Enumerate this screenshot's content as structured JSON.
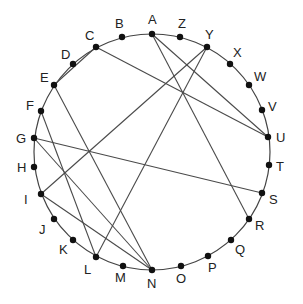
{
  "diagram": {
    "type": "circular-graph",
    "circle": {
      "cx": 152,
      "cy": 152,
      "r": 118,
      "stroke": "#444444"
    },
    "nodes": [
      {
        "id": "A",
        "x": 152,
        "y": 34,
        "lx": 148,
        "ly": 24
      },
      {
        "id": "Z",
        "x": 180,
        "y": 37,
        "lx": 178,
        "ly": 28
      },
      {
        "id": "Y",
        "x": 207,
        "y": 47,
        "lx": 205,
        "ly": 39
      },
      {
        "id": "X",
        "x": 230,
        "y": 64,
        "lx": 233,
        "ly": 57
      },
      {
        "id": "W",
        "x": 249,
        "y": 85,
        "lx": 254,
        "ly": 81
      },
      {
        "id": "V",
        "x": 262,
        "y": 110,
        "lx": 268,
        "ly": 111
      },
      {
        "id": "U",
        "x": 268,
        "y": 137,
        "lx": 276,
        "ly": 142
      },
      {
        "id": "T",
        "x": 269,
        "y": 165,
        "lx": 276,
        "ly": 171
      },
      {
        "id": "S",
        "x": 262,
        "y": 193,
        "lx": 269,
        "ly": 204
      },
      {
        "id": "R",
        "x": 249,
        "y": 219,
        "lx": 255,
        "ly": 230
      },
      {
        "id": "Q",
        "x": 231,
        "y": 240,
        "lx": 235,
        "ly": 254
      },
      {
        "id": "P",
        "x": 208,
        "y": 256,
        "lx": 208,
        "ly": 272
      },
      {
        "id": "O",
        "x": 181,
        "y": 266,
        "lx": 176,
        "ly": 283
      },
      {
        "id": "N",
        "x": 152,
        "y": 270,
        "lx": 147,
        "ly": 288
      },
      {
        "id": "M",
        "x": 123,
        "y": 266,
        "lx": 115,
        "ly": 282
      },
      {
        "id": "L",
        "x": 96,
        "y": 257,
        "lx": 84,
        "ly": 274
      },
      {
        "id": "K",
        "x": 73,
        "y": 240,
        "lx": 59,
        "ly": 254
      },
      {
        "id": "J",
        "x": 54,
        "y": 219,
        "lx": 39,
        "ly": 234
      },
      {
        "id": "I",
        "x": 41,
        "y": 194,
        "lx": 24,
        "ly": 204
      },
      {
        "id": "H",
        "x": 34,
        "y": 167,
        "lx": 17,
        "ly": 172
      },
      {
        "id": "G",
        "x": 34,
        "y": 138,
        "lx": 16,
        "ly": 143
      },
      {
        "id": "F",
        "x": 41,
        "y": 111,
        "lx": 26,
        "ly": 110
      },
      {
        "id": "E",
        "x": 54,
        "y": 85,
        "lx": 40,
        "ly": 82
      },
      {
        "id": "D",
        "x": 73,
        "y": 64,
        "lx": 61,
        "ly": 59
      },
      {
        "id": "C",
        "x": 96,
        "y": 47,
        "lx": 85,
        "ly": 40
      },
      {
        "id": "B",
        "x": 122,
        "y": 37,
        "lx": 115,
        "ly": 28
      }
    ],
    "edges": [
      {
        "from": "A",
        "to": "U"
      },
      {
        "from": "A",
        "to": "R"
      },
      {
        "from": "Y",
        "to": "I"
      },
      {
        "from": "Y",
        "to": "L"
      },
      {
        "from": "C",
        "to": "U"
      },
      {
        "from": "C",
        "to": "E"
      },
      {
        "from": "E",
        "to": "N"
      },
      {
        "from": "F",
        "to": "L"
      },
      {
        "from": "G",
        "to": "S"
      },
      {
        "from": "G",
        "to": "N"
      },
      {
        "from": "I",
        "to": "N"
      }
    ],
    "colors": {
      "edge": "#4a4a4a",
      "node": "#111111",
      "label": "#222222"
    }
  }
}
